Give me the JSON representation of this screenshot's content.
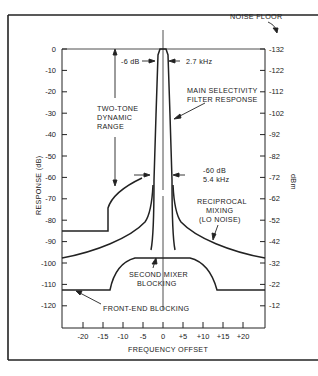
{
  "chart_data": {
    "type": "line",
    "title": "",
    "xlabel": "FREQUENCY OFFSET",
    "ylabel": "RESPONSE (dB)",
    "y2label": "dBm",
    "xlim": [
      -25,
      25
    ],
    "ylim": [
      -130,
      0
    ],
    "grid": false,
    "x_ticks": [
      "-20",
      "-15",
      "-10",
      "-5",
      "0",
      "+5",
      "+10",
      "+15",
      "+20"
    ],
    "x_tick_values": [
      -20,
      -15,
      -10,
      -5,
      0,
      5,
      10,
      15,
      20
    ],
    "y_ticks": [
      "0",
      "-10",
      "-20",
      "-30",
      "-40",
      "-50",
      "-60",
      "-70",
      "-80",
      "-90",
      "-100",
      "-110",
      "-120"
    ],
    "y_tick_values": [
      0,
      -10,
      -20,
      -30,
      -40,
      -50,
      -60,
      -70,
      -80,
      -90,
      -100,
      -110,
      -120
    ],
    "y2_ticks": [
      "-132",
      "-122",
      "-112",
      "-102",
      "-92",
      "-82",
      "-72",
      "-62",
      "-52",
      "-42",
      "-32",
      "-22",
      "-12"
    ],
    "series": [
      {
        "name": "Main selectivity filter response",
        "x": [
          -25,
          -3,
          -2.7,
          -2.2,
          -1.35,
          -1.0,
          1.0,
          1.35,
          2.2,
          2.7,
          3,
          25
        ],
        "values": [
          -130,
          -75,
          -60,
          -30,
          -6,
          0,
          0,
          -6,
          -30,
          -60,
          -75,
          -130
        ]
      },
      {
        "name": "Reciprocal mixing (LO noise)",
        "x": [
          -25,
          -20,
          -15,
          -10,
          -5,
          -3,
          3,
          5,
          10,
          15,
          20,
          25
        ],
        "values": [
          -97,
          -93,
          -88,
          -82,
          -75,
          -70,
          -70,
          -75,
          -82,
          -88,
          -93,
          -97
        ]
      },
      {
        "name": "Second mixer blocking",
        "x": [
          -25,
          -13,
          -12,
          -10,
          -8,
          -5,
          0,
          5,
          8,
          10,
          12,
          13,
          25
        ],
        "values": [
          -113,
          -113,
          -106,
          -101,
          -98.5,
          -97,
          -96.5,
          -97,
          -98.5,
          -101,
          -106,
          -113,
          -113
        ]
      },
      {
        "name": "Two-tone dynamic range",
        "x": [
          -25,
          -14,
          -14,
          -12,
          -10,
          -8,
          -6,
          -4
        ],
        "values": [
          -85,
          -85,
          -75,
          -67,
          -62,
          -58,
          -55,
          -53
        ]
      }
    ],
    "annotations": [
      {
        "text": "NOISE FLOOR",
        "points_to": "-132 dBm"
      },
      {
        "text": "-6 dB",
        "at": "-6 dB filter edge"
      },
      {
        "text": "2.7 kHz",
        "at": "-6 dB bandwidth"
      },
      {
        "text": "MAIN SELECTIVITY FILTER RESPONSE"
      },
      {
        "text": "TWO-TONE DYNAMIC RANGE"
      },
      {
        "text": "-60 dB 5.4 kHz",
        "at": "-60 dB bandwidth"
      },
      {
        "text": "RECIPROCAL MIXING (LO NOISE)"
      },
      {
        "text": "SECOND MIXER BLOCKING"
      },
      {
        "text": "FRONT-END BLOCKING"
      }
    ],
    "legend": "none"
  },
  "labels": {
    "noise_floor": "NOISE FLOOR",
    "minus6db": "-6 dB",
    "bw27": "2.7 kHz",
    "main_sel_1": "MAIN SELECTIVITY",
    "main_sel_2": "FILTER RESPONSE",
    "two_tone_1": "TWO-TONE",
    "two_tone_2": "DYNAMIC",
    "two_tone_3": "RANGE",
    "minus60db": "-60 dB",
    "bw54": "5.4 kHz",
    "recip_1": "RECIPROCAL",
    "recip_2": "MIXING",
    "recip_3": "(LO NOISE)",
    "second_mixer_1": "SECOND MIXER",
    "second_mixer_2": "BLOCKING",
    "front_end": "FRONT-END BLOCKING",
    "xlabel": "FREQUENCY OFFSET",
    "ylabel": "RESPONSE (dB)",
    "y2label": "dBm"
  }
}
